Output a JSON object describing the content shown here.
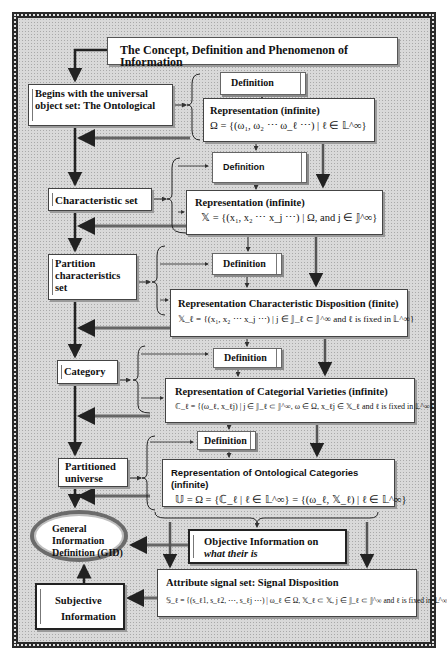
{
  "title": "The Concept, Definition and Phenomenon of Information",
  "left_column": {
    "begins": [
      "Begins with the universal",
      "object set: The Ontological"
    ],
    "characteristic_set": "Characteristic set",
    "partition": [
      "Partition",
      "characteristics",
      "set"
    ],
    "category": "Category",
    "partitioned_universe": [
      "Partitioned",
      "universe"
    ],
    "gid": [
      "General",
      "Information",
      "Definition (GID)"
    ],
    "subjective": [
      "Subjective",
      "Information"
    ]
  },
  "definition_label": "Definition",
  "representations": [
    {
      "heading": "Representation (infinite)",
      "formula": "Ω = {(ω₁, ω₂ ⋯ ω_ℓ ⋯) | ℓ ∈ 𝕃^∞}"
    },
    {
      "heading": "Representation (infinite)",
      "formula": "𝕏 = {(x₁, x₂ ⋯ x_j ⋯) | Ω, and j ∈ 𝕁^∞}"
    },
    {
      "heading": "Representation Characteristic Disposition (finite)",
      "formula": "𝕏_ℓ = {(x₁, x₂ ⋯ x_j ⋯) | j ∈ 𝕁_ℓ ⊂ 𝕁^∞ and ℓ is fixed in 𝕃^∞}"
    },
    {
      "heading": "Representation of Categorial Varieties (infinite)",
      "formula": "ℂ_ℓ = {(ω_ℓ, x_ℓj) | j ∈ 𝕁_ℓ ⊂ 𝕁^∞, ω ∈ Ω, x_ℓj ∈ 𝕏_ℓ and ℓ is fixed in 𝕃^∞}"
    },
    {
      "heading": "Representation of Ontological Categories (infinite)",
      "formula": "𝕌 = Ω = {ℂ_ℓ | ℓ ∈ 𝕃^∞} = {(ω_ℓ, 𝕏_ℓ) | ℓ ∈ 𝕃^∞}"
    }
  ],
  "objective": {
    "prefix": "Objective Information on ",
    "italic": "what their is"
  },
  "attribute": {
    "heading": "Attribute signal set: Signal Disposition",
    "formula": "𝕊_ℓ = {(s_ℓ1, s_ℓ2, ⋯, s_ℓj ⋯) | ω_ℓ ∈ Ω, 𝕏_ℓ ⊂ 𝕏, j ∈ 𝕁_ℓ ⊂ 𝕁^∞ and ℓ is fixed in 𝕃^∞}"
  }
}
